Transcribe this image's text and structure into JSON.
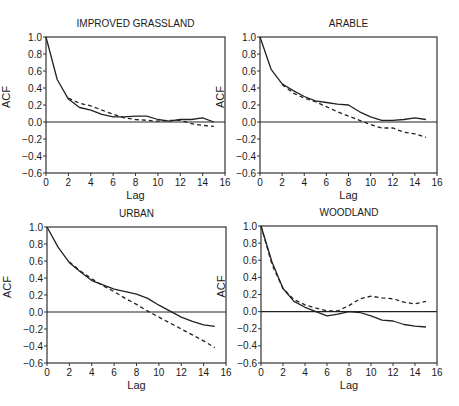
{
  "chart_data": [
    {
      "type": "line",
      "title": "IMPROVED GRASSLAND",
      "xlabel": "Lag",
      "ylabel": "ACF",
      "xlim": [
        0,
        16
      ],
      "ylim": [
        -0.6,
        1.0
      ],
      "xticks": [
        0,
        2,
        4,
        6,
        8,
        10,
        12,
        14,
        16
      ],
      "yticks": [
        1.0,
        0.8,
        0.6,
        0.4,
        0.2,
        0.0,
        -0.2,
        -0.4,
        -0.6
      ],
      "ytick_labels": [
        "1.0",
        "0.8",
        "0.6",
        "0.4",
        "0.2",
        "0.0",
        "−0.2",
        "−0.4",
        "−0.6"
      ],
      "series": [
        {
          "name": "observed",
          "style": "solid",
          "x": [
            0,
            1,
            2,
            3,
            4,
            5,
            6,
            7,
            8,
            9,
            10,
            11,
            12,
            13,
            14,
            15
          ],
          "values": [
            1.0,
            0.5,
            0.27,
            0.17,
            0.14,
            0.09,
            0.06,
            0.06,
            0.07,
            0.07,
            0.03,
            0.01,
            0.03,
            0.03,
            0.05,
            0.0
          ]
        },
        {
          "name": "model",
          "style": "dashed",
          "x": [
            2,
            3,
            4,
            5,
            6,
            7,
            8,
            9,
            10,
            11,
            12,
            13,
            14,
            15
          ],
          "values": [
            0.28,
            0.22,
            0.19,
            0.14,
            0.09,
            0.05,
            0.03,
            0.02,
            0.01,
            0.02,
            0.02,
            -0.02,
            -0.04,
            -0.05
          ]
        }
      ]
    },
    {
      "type": "line",
      "title": "ARABLE",
      "xlabel": "Lag",
      "ylabel": "ACF",
      "xlim": [
        0,
        16
      ],
      "ylim": [
        -0.6,
        1.0
      ],
      "xticks": [
        0,
        2,
        4,
        6,
        8,
        10,
        12,
        14,
        16
      ],
      "yticks": [
        1.0,
        0.8,
        0.6,
        0.4,
        0.2,
        0.0,
        -0.2,
        -0.4,
        -0.6
      ],
      "ytick_labels": [
        "1.0",
        "0.8",
        "0.6",
        "0.4",
        "0.2",
        "0.0",
        "−0.2",
        "−0.4",
        "−0.6"
      ],
      "series": [
        {
          "name": "observed",
          "style": "solid",
          "x": [
            0,
            1,
            2,
            3,
            4,
            5,
            6,
            7,
            8,
            9,
            10,
            11,
            12,
            13,
            14,
            15
          ],
          "values": [
            1.0,
            0.62,
            0.45,
            0.37,
            0.3,
            0.25,
            0.23,
            0.21,
            0.2,
            0.12,
            0.06,
            0.02,
            0.02,
            0.03,
            0.05,
            0.03
          ]
        },
        {
          "name": "model",
          "style": "dashed",
          "x": [
            2,
            3,
            4,
            5,
            6,
            7,
            8,
            9,
            10,
            11,
            12,
            13,
            14,
            15
          ],
          "values": [
            0.44,
            0.34,
            0.28,
            0.24,
            0.18,
            0.12,
            0.07,
            0.02,
            -0.03,
            -0.07,
            -0.07,
            -0.12,
            -0.14,
            -0.18
          ]
        }
      ]
    },
    {
      "type": "line",
      "title": "URBAN",
      "xlabel": "Lag",
      "ylabel": "ACF",
      "xlim": [
        0,
        16
      ],
      "ylim": [
        -0.6,
        1.0
      ],
      "xticks": [
        0,
        2,
        4,
        6,
        8,
        10,
        12,
        14,
        16
      ],
      "yticks": [
        1.0,
        0.8,
        0.6,
        0.4,
        0.2,
        0.0,
        -0.2,
        -0.4,
        -0.6
      ],
      "ytick_labels": [
        "1.0",
        "0.8",
        "0.6",
        "0.4",
        "0.2",
        "0.0",
        "−0.2",
        "−0.4",
        "−0.6"
      ],
      "series": [
        {
          "name": "observed",
          "style": "solid",
          "x": [
            0,
            1,
            2,
            3,
            4,
            5,
            6,
            7,
            8,
            9,
            10,
            11,
            12,
            13,
            14,
            15
          ],
          "values": [
            1.0,
            0.76,
            0.58,
            0.47,
            0.37,
            0.32,
            0.27,
            0.24,
            0.21,
            0.16,
            0.08,
            0.01,
            -0.06,
            -0.11,
            -0.15,
            -0.17
          ]
        },
        {
          "name": "model",
          "style": "dashed",
          "x": [
            2,
            3,
            4,
            5,
            6,
            7,
            8,
            9,
            10,
            11,
            12,
            13,
            14,
            15
          ],
          "values": [
            0.59,
            0.48,
            0.39,
            0.31,
            0.24,
            0.16,
            0.09,
            0.01,
            -0.06,
            -0.13,
            -0.2,
            -0.27,
            -0.34,
            -0.42
          ]
        }
      ]
    },
    {
      "type": "line",
      "title": "WOODLAND",
      "xlabel": "Lag",
      "ylabel": "ACF",
      "xlim": [
        0,
        16
      ],
      "ylim": [
        -0.6,
        1.0
      ],
      "xticks": [
        0,
        2,
        4,
        6,
        8,
        10,
        12,
        14,
        16
      ],
      "yticks": [
        1.0,
        0.8,
        0.6,
        0.4,
        0.2,
        0.0,
        -0.2,
        -0.4,
        -0.6
      ],
      "ytick_labels": [
        "1.0",
        "0.8",
        "0.6",
        "0.4",
        "0.2",
        "0.0",
        "−0.2",
        "−0.4",
        "−0.6"
      ],
      "series": [
        {
          "name": "observed",
          "style": "solid",
          "x": [
            0,
            1,
            2,
            3,
            4,
            5,
            6,
            7,
            8,
            9,
            10,
            11,
            12,
            13,
            14,
            15
          ],
          "values": [
            1.0,
            0.58,
            0.27,
            0.12,
            0.05,
            0.0,
            -0.05,
            -0.03,
            0.0,
            -0.01,
            -0.05,
            -0.1,
            -0.11,
            -0.15,
            -0.17,
            -0.18
          ]
        },
        {
          "name": "model",
          "style": "dashed",
          "x": [
            0,
            1,
            2,
            3,
            4,
            5,
            6,
            7,
            8,
            9,
            10,
            11,
            12,
            13,
            14,
            15
          ],
          "values": [
            1.0,
            0.55,
            0.27,
            0.14,
            0.08,
            0.04,
            0.01,
            0.01,
            0.07,
            0.15,
            0.18,
            0.16,
            0.15,
            0.11,
            0.09,
            0.12
          ]
        }
      ]
    }
  ]
}
